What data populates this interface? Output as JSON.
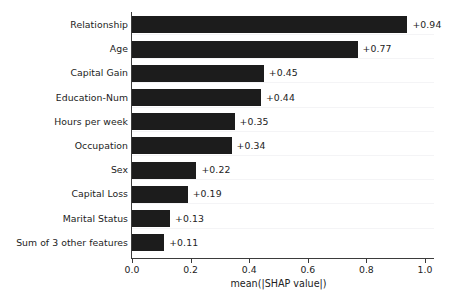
{
  "chart_data": {
    "type": "bar",
    "orientation": "horizontal",
    "title": "",
    "xlabel": "mean(|SHAP value|)",
    "ylabel": "",
    "xlim": [
      0.0,
      1.0
    ],
    "grid": true,
    "legend": false,
    "categories": [
      "Relationship",
      "Age",
      "Capital Gain",
      "Education-Num",
      "Hours per week",
      "Occupation",
      "Sex",
      "Capital Loss",
      "Marital Status",
      "Sum of 3 other features"
    ],
    "values": [
      0.94,
      0.77,
      0.45,
      0.44,
      0.35,
      0.34,
      0.22,
      0.19,
      0.13,
      0.11
    ],
    "value_labels": [
      "+0.94",
      "+0.77",
      "+0.45",
      "+0.44",
      "+0.35",
      "+0.34",
      "+0.22",
      "+0.19",
      "+0.13",
      "+0.11"
    ],
    "xticks": [
      0.0,
      0.2,
      0.4,
      0.6,
      0.8,
      1.0
    ],
    "xtick_labels": [
      "0.0",
      "0.2",
      "0.4",
      "0.6",
      "0.8",
      "1.0"
    ],
    "bar_color": "#1c1c1c",
    "axis_color": "#3b3b3b",
    "text_color": "#222222",
    "background_color": "#ffffff"
  }
}
